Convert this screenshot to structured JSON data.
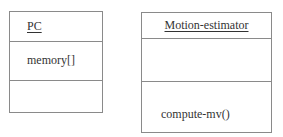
{
  "diagram": {
    "type": "uml-class-diagram",
    "classes": [
      {
        "name": "PC",
        "attributes": [
          "memory[]"
        ],
        "operations": []
      },
      {
        "name": "Motion-estimator",
        "attributes": [],
        "operations": [
          "compute-mv()"
        ]
      }
    ],
    "colors": {
      "border": "#8a8a8a",
      "text": "#333333",
      "background": "#ffffff"
    }
  }
}
